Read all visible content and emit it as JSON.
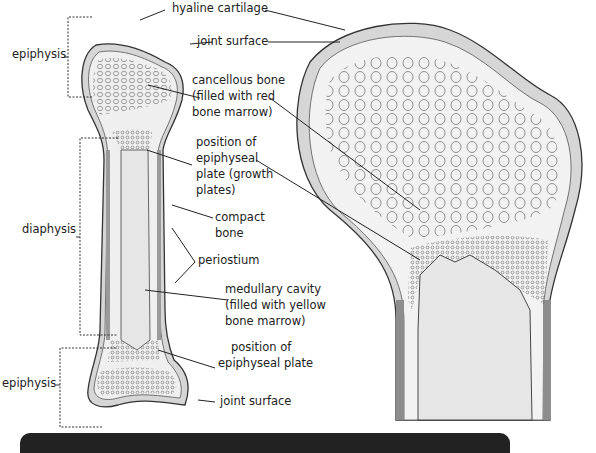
{
  "diagram": {
    "colors": {
      "cartilage": "#d4d4d4",
      "compact_bone": "#9a9a9a",
      "marrow_cavity": "#e9e9e9",
      "outline": "#333333",
      "footer_bar": "#222222"
    },
    "labels": {
      "hyaline_cartilage": "hyaline cartilage",
      "joint_surface_top": "joint surface",
      "epiphysis_top": "epiphysis",
      "cancellous_1": "cancellous bone",
      "cancellous_2": "(filled with red",
      "cancellous_3": "bone marrow)",
      "plate_1": "position of",
      "plate_2": "epiphyseal",
      "plate_3": "plate (growth",
      "plate_4": "plates)",
      "diaphysis": "diaphysis",
      "compact_1": "compact",
      "compact_2": "bone",
      "periostium": "periostium",
      "medullary_1": "medullary cavity",
      "medullary_2": "(filled with yellow",
      "medullary_3": "bone marrow)",
      "plate_bottom_1": "position of",
      "plate_bottom_2": "epiphyseal plate",
      "epiphysis_bottom": "epiphysis",
      "joint_surface_bottom": "joint surface"
    }
  }
}
